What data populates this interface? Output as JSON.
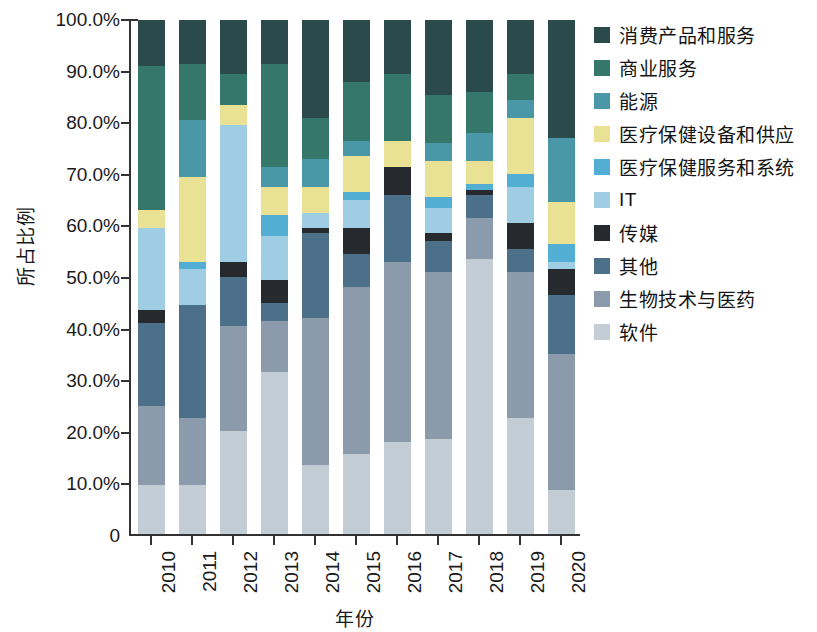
{
  "chart_data": {
    "type": "bar",
    "subtype": "stacked-100-percent",
    "title": "",
    "xlabel": "年份",
    "ylabel": "所占比例",
    "categories": [
      "2010",
      "2011",
      "2012",
      "2013",
      "2014",
      "2015",
      "2016",
      "2017",
      "2018",
      "2019",
      "2020"
    ],
    "ylim": [
      0,
      100
    ],
    "ytick_labels": [
      "0",
      "10.0%",
      "20.0%",
      "30.0%",
      "40.0%",
      "50.0%",
      "60.0%",
      "70.0%",
      "80.0%",
      "90.0%",
      "100.0%"
    ],
    "ytick_values": [
      0,
      10,
      20,
      30,
      40,
      50,
      60,
      70,
      80,
      90,
      100
    ],
    "grid": false,
    "legend_position": "right",
    "stack_order_bottom_to_top": [
      "软件",
      "生物技术与医药",
      "其他",
      "传媒",
      "IT",
      "医疗保健服务和系统",
      "医疗保健设备和供应",
      "能源",
      "商业服务",
      "消费产品和服务"
    ],
    "series": [
      {
        "name": "消费产品和服务",
        "color": "#2b4a4c",
        "values": [
          9.0,
          8.5,
          10.5,
          8.5,
          19.0,
          12.0,
          10.5,
          14.5,
          14.0,
          10.5,
          23.0
        ]
      },
      {
        "name": "商业服务",
        "color": "#35776b",
        "values": [
          28.0,
          11.0,
          6.0,
          20.0,
          8.0,
          11.5,
          13.0,
          9.5,
          8.0,
          5.0,
          0.0
        ]
      },
      {
        "name": "能源",
        "color": "#4a97a8",
        "values": [
          0.0,
          11.0,
          0.0,
          4.0,
          5.5,
          3.0,
          0.0,
          3.5,
          5.5,
          3.5,
          12.5
        ]
      },
      {
        "name": "医疗保健设备和供应",
        "color": "#e9e294",
        "values": [
          3.5,
          16.5,
          4.0,
          5.5,
          5.0,
          7.0,
          5.0,
          7.0,
          4.5,
          11.0,
          8.0
        ]
      },
      {
        "name": "医疗保健服务和系统",
        "color": "#53aed4",
        "values": [
          0.0,
          1.5,
          0.0,
          4.0,
          0.0,
          1.5,
          0.0,
          2.0,
          1.0,
          2.5,
          3.5
        ]
      },
      {
        "name": "IT",
        "color": "#9fcde4",
        "values": [
          16.0,
          7.0,
          26.5,
          8.5,
          3.0,
          5.5,
          0.0,
          5.0,
          0.0,
          7.0,
          1.5
        ]
      },
      {
        "name": "传媒",
        "color": "#26292e",
        "values": [
          2.5,
          0.0,
          3.0,
          4.5,
          1.0,
          5.0,
          5.5,
          1.5,
          1.0,
          5.0,
          5.0
        ]
      },
      {
        "name": "其他",
        "color": "#4c6f8a",
        "values": [
          16.0,
          22.0,
          9.5,
          3.5,
          16.5,
          6.5,
          13.0,
          6.0,
          4.5,
          4.5,
          11.5
        ]
      },
      {
        "name": "生物技术与医药",
        "color": "#8b9bab",
        "values": [
          15.5,
          13.0,
          20.5,
          10.0,
          28.5,
          32.5,
          35.0,
          32.5,
          8.0,
          28.5,
          26.5
        ]
      },
      {
        "name": "软件",
        "color": "#c2cdd6",
        "values": [
          9.5,
          9.5,
          20.0,
          31.5,
          13.5,
          15.5,
          18.0,
          18.5,
          53.5,
          22.5,
          8.5
        ]
      }
    ]
  },
  "legend": {
    "items": [
      {
        "label": "消费产品和服务",
        "color": "#2b4a4c"
      },
      {
        "label": "商业服务",
        "color": "#35776b"
      },
      {
        "label": "能源",
        "color": "#4a97a8"
      },
      {
        "label": "医疗保健设备和供应",
        "color": "#e9e294"
      },
      {
        "label": "医疗保健服务和系统",
        "color": "#53aed4"
      },
      {
        "label": "IT",
        "color": "#9fcde4"
      },
      {
        "label": "传媒",
        "color": "#26292e"
      },
      {
        "label": "其他",
        "color": "#4c6f8a"
      },
      {
        "label": "生物技术与医药",
        "color": "#8b9bab"
      },
      {
        "label": "软件",
        "color": "#c2cdd6"
      }
    ]
  }
}
